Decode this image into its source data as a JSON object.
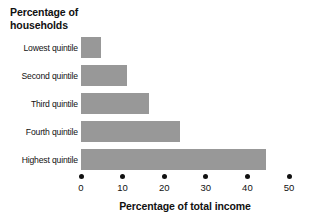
{
  "chart_data": {
    "type": "bar",
    "orientation": "horizontal",
    "title": "",
    "xlabel": "Percentage of total income",
    "ylabel": "Percentage of\nhouseholds",
    "categories": [
      "Lowest quintile",
      "Second quintile",
      "Third quintile",
      "Fourth quintile",
      "Highest quintile"
    ],
    "values": [
      4.9,
      11.0,
      16.4,
      23.9,
      44.5
    ],
    "xlim": [
      0,
      50
    ],
    "xticks": [
      0,
      10,
      20,
      30,
      40,
      50
    ],
    "xtick_labels": [
      "0",
      "10",
      "20",
      "30",
      "40",
      "50"
    ],
    "grid": false,
    "legend": null,
    "bar_color": "#989898",
    "text_color": "#111111",
    "background": "#ffffff",
    "tick_marker": "filled-circle"
  }
}
